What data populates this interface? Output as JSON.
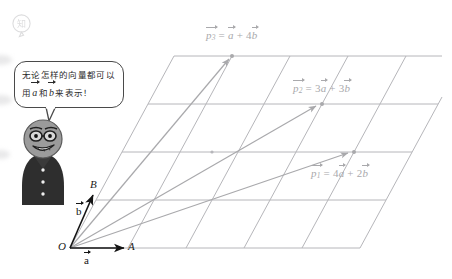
{
  "figure": {
    "kind": "vector-lattice-diagram",
    "background_color": "#ffffff",
    "lattice_color": "#b6b6ba",
    "vector_color": "#a9a9ac",
    "basis_color": "#141414",
    "origin_label": "O",
    "point_a_label": "A",
    "point_b_label": "B",
    "basis": [
      {
        "name": "a-vector",
        "letter": "a",
        "from": "O",
        "to": "A"
      },
      {
        "name": "b-vector",
        "letter": "b",
        "from": "O",
        "to": "B"
      }
    ],
    "grid": {
      "columns": 5,
      "rows": 4
    }
  },
  "labels": {
    "p1": {
      "lhs_letter": "p",
      "lhs_sub": "1",
      "eq": "=",
      "a_coef": "4",
      "plus": "+",
      "b_coef": "2",
      "a_letter": "a",
      "b_letter": "b"
    },
    "p2": {
      "lhs_letter": "p",
      "lhs_sub": "2",
      "eq": "=",
      "a_coef": "3",
      "plus": "+",
      "b_coef": "3",
      "a_letter": "a",
      "b_letter": "b"
    },
    "p3": {
      "lhs_letter": "p",
      "lhs_sub": "3",
      "eq": "=",
      "a_coef": "",
      "plus": "+",
      "b_coef": "4",
      "a_letter": "a",
      "b_letter": "b"
    }
  },
  "speech": {
    "line1_pre": "无论怎样的向量都可以",
    "line2_pre": "用",
    "line2_a": "a",
    "line2_mid": "和",
    "line2_b": "b",
    "line2_post": "来表示！"
  },
  "character": {
    "name": "cartoon-teacher",
    "head_color": "#9b9b9b",
    "body_color": "#2e2e2e",
    "has_glasses": true,
    "buttons": 3
  },
  "watermark": {
    "name": "page-watermark",
    "glyph": "知"
  }
}
